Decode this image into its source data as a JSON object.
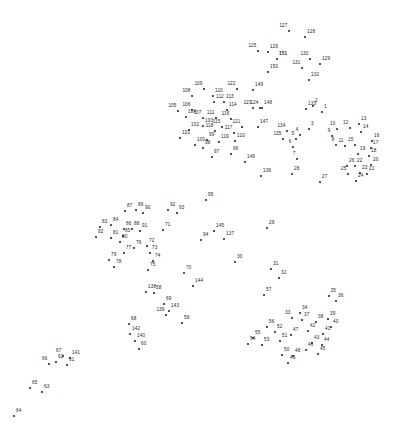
{
  "puzzle": {
    "type": "connect-the-dots",
    "width": 396,
    "height": 445,
    "background_color": "#ffffff",
    "dot_color": "#1a1a1a",
    "label_color": "#1a1a1a",
    "total_dots": 151,
    "dots": [
      {
        "n": "1",
        "x": 322,
        "y": 112,
        "pos": "ne"
      },
      {
        "n": "2",
        "x": 313,
        "y": 106,
        "pos": "ne"
      },
      {
        "n": "3",
        "x": 309,
        "y": 129,
        "pos": "ne"
      },
      {
        "n": "4",
        "x": 300,
        "y": 135,
        "pos": "nw"
      },
      {
        "n": "5",
        "x": 296,
        "y": 139,
        "pos": "nw"
      },
      {
        "n": "6",
        "x": 293,
        "y": 147,
        "pos": "nw"
      },
      {
        "n": "7",
        "x": 297,
        "y": 159,
        "pos": "nw"
      },
      {
        "n": "8",
        "x": 336,
        "y": 145,
        "pos": "nw"
      },
      {
        "n": "9",
        "x": 332,
        "y": 136,
        "pos": "nw"
      },
      {
        "n": "10",
        "x": 337,
        "y": 129,
        "pos": "nw"
      },
      {
        "n": "11",
        "x": 345,
        "y": 146,
        "pos": "nw"
      },
      {
        "n": "12",
        "x": 350,
        "y": 128,
        "pos": "nw"
      },
      {
        "n": "13",
        "x": 359,
        "y": 124,
        "pos": "ne"
      },
      {
        "n": "14",
        "x": 361,
        "y": 132,
        "pos": "ne"
      },
      {
        "n": "15",
        "x": 355,
        "y": 145,
        "pos": "nw"
      },
      {
        "n": "16",
        "x": 372,
        "y": 141,
        "pos": "ne"
      },
      {
        "n": "17",
        "x": 371,
        "y": 148,
        "pos": "ne"
      },
      {
        "n": "18",
        "x": 369,
        "y": 156,
        "pos": "ne"
      },
      {
        "n": "19",
        "x": 358,
        "y": 154,
        "pos": "ne"
      },
      {
        "n": "20",
        "x": 371,
        "y": 165,
        "pos": "ne"
      },
      {
        "n": "21",
        "x": 367,
        "y": 174,
        "pos": "ne"
      },
      {
        "n": "22",
        "x": 355,
        "y": 166,
        "pos": "ne"
      },
      {
        "n": "23",
        "x": 360,
        "y": 173,
        "pos": "ne"
      },
      {
        "n": "24",
        "x": 356,
        "y": 181,
        "pos": "ne"
      },
      {
        "n": "25",
        "x": 348,
        "y": 174,
        "pos": "nw"
      },
      {
        "n": "26",
        "x": 347,
        "y": 166,
        "pos": "ne"
      },
      {
        "n": "27",
        "x": 320,
        "y": 182,
        "pos": "ne"
      },
      {
        "n": "28",
        "x": 292,
        "y": 174,
        "pos": "ne"
      },
      {
        "n": "29",
        "x": 267,
        "y": 228,
        "pos": "ne"
      },
      {
        "n": "30",
        "x": 235,
        "y": 262,
        "pos": "ne"
      },
      {
        "n": "31",
        "x": 271,
        "y": 269,
        "pos": "ne"
      },
      {
        "n": "32",
        "x": 279,
        "y": 278,
        "pos": "ne"
      },
      {
        "n": "33",
        "x": 292,
        "y": 318,
        "pos": "nw"
      },
      {
        "n": "34",
        "x": 300,
        "y": 313,
        "pos": "ne"
      },
      {
        "n": "35",
        "x": 329,
        "y": 296,
        "pos": "n"
      },
      {
        "n": "36",
        "x": 336,
        "y": 301,
        "pos": "ne"
      },
      {
        "n": "37",
        "x": 302,
        "y": 320,
        "pos": "ne"
      },
      {
        "n": "38",
        "x": 316,
        "y": 322,
        "pos": "ne"
      },
      {
        "n": "39",
        "x": 328,
        "y": 319,
        "pos": "ne"
      },
      {
        "n": "40",
        "x": 331,
        "y": 327,
        "pos": "ne"
      },
      {
        "n": "41",
        "x": 323,
        "y": 334,
        "pos": "ne"
      },
      {
        "n": "42",
        "x": 308,
        "y": 331,
        "pos": "ne"
      },
      {
        "n": "43",
        "x": 312,
        "y": 343,
        "pos": "ne"
      },
      {
        "n": "44",
        "x": 322,
        "y": 345,
        "pos": "ne"
      },
      {
        "n": "45",
        "x": 318,
        "y": 354,
        "pos": "ne"
      },
      {
        "n": "46",
        "x": 306,
        "y": 350,
        "pos": "ne"
      },
      {
        "n": "47",
        "x": 291,
        "y": 335,
        "pos": "ne"
      },
      {
        "n": "48",
        "x": 293,
        "y": 356,
        "pos": "ne"
      },
      {
        "n": "49",
        "x": 288,
        "y": 363,
        "pos": "ne"
      },
      {
        "n": "50",
        "x": 282,
        "y": 355,
        "pos": "ne"
      },
      {
        "n": "51",
        "x": 280,
        "y": 341,
        "pos": "ne"
      },
      {
        "n": "52",
        "x": 275,
        "y": 332,
        "pos": "ne"
      },
      {
        "n": "53",
        "x": 262,
        "y": 345,
        "pos": "ne"
      },
      {
        "n": "54",
        "x": 248,
        "y": 344,
        "pos": "ne"
      },
      {
        "n": "55",
        "x": 253,
        "y": 338,
        "pos": "ne"
      },
      {
        "n": "56",
        "x": 267,
        "y": 327,
        "pos": "ne"
      },
      {
        "n": "57",
        "x": 264,
        "y": 295,
        "pos": "ne"
      },
      {
        "n": "58",
        "x": 154,
        "y": 293,
        "pos": "ne"
      },
      {
        "n": "59",
        "x": 182,
        "y": 323,
        "pos": "ne"
      },
      {
        "n": "60",
        "x": 139,
        "y": 349,
        "pos": "ne"
      },
      {
        "n": "61",
        "x": 67,
        "y": 365,
        "pos": "ne"
      },
      {
        "n": "62",
        "x": 56,
        "y": 362,
        "pos": "ne"
      },
      {
        "n": "63",
        "x": 42,
        "y": 392,
        "pos": "ne"
      },
      {
        "n": "64",
        "x": 14,
        "y": 416,
        "pos": "ne"
      },
      {
        "n": "65",
        "x": 30,
        "y": 388,
        "pos": "ne"
      },
      {
        "n": "66",
        "x": 49,
        "y": 364,
        "pos": "nw"
      },
      {
        "n": "67",
        "x": 63,
        "y": 356,
        "pos": "nw"
      },
      {
        "n": "68",
        "x": 129,
        "y": 324,
        "pos": "ne"
      },
      {
        "n": "69",
        "x": 164,
        "y": 304,
        "pos": "ne"
      },
      {
        "n": "70",
        "x": 184,
        "y": 273,
        "pos": "ne"
      },
      {
        "n": "71",
        "x": 163,
        "y": 230,
        "pos": "ne"
      },
      {
        "n": "72",
        "x": 147,
        "y": 246,
        "pos": "ne"
      },
      {
        "n": "73",
        "x": 150,
        "y": 253,
        "pos": "ne"
      },
      {
        "n": "74",
        "x": 153,
        "y": 261,
        "pos": "ne"
      },
      {
        "n": "75",
        "x": 148,
        "y": 270,
        "pos": "ne"
      },
      {
        "n": "76",
        "x": 134,
        "y": 248,
        "pos": "ne"
      },
      {
        "n": "77",
        "x": 124,
        "y": 253,
        "pos": "ne"
      },
      {
        "n": "78",
        "x": 114,
        "y": 267,
        "pos": "ne"
      },
      {
        "n": "79",
        "x": 109,
        "y": 260,
        "pos": "ne"
      },
      {
        "n": "80",
        "x": 120,
        "y": 242,
        "pos": "ne"
      },
      {
        "n": "81",
        "x": 111,
        "y": 238,
        "pos": "ne"
      },
      {
        "n": "82",
        "x": 96,
        "y": 237,
        "pos": "ne"
      },
      {
        "n": "83",
        "x": 100,
        "y": 227,
        "pos": "ne"
      },
      {
        "n": "84",
        "x": 111,
        "y": 225,
        "pos": "ne"
      },
      {
        "n": "85",
        "x": 123,
        "y": 236,
        "pos": "ne"
      },
      {
        "n": "86",
        "x": 124,
        "y": 229,
        "pos": "ne"
      },
      {
        "n": "87",
        "x": 125,
        "y": 211,
        "pos": "ne"
      },
      {
        "n": "88",
        "x": 132,
        "y": 229,
        "pos": "ne"
      },
      {
        "n": "89",
        "x": 136,
        "y": 210,
        "pos": "ne"
      },
      {
        "n": "90",
        "x": 143,
        "y": 213,
        "pos": "ne"
      },
      {
        "n": "91",
        "x": 140,
        "y": 231,
        "pos": "ne"
      },
      {
        "n": "92",
        "x": 168,
        "y": 210,
        "pos": "ne"
      },
      {
        "n": "93",
        "x": 177,
        "y": 213,
        "pos": "ne"
      },
      {
        "n": "94",
        "x": 201,
        "y": 240,
        "pos": "ne"
      },
      {
        "n": "95",
        "x": 206,
        "y": 200,
        "pos": "ne"
      },
      {
        "n": "96",
        "x": 231,
        "y": 154,
        "pos": "ne"
      },
      {
        "n": "97",
        "x": 212,
        "y": 157,
        "pos": "ne"
      },
      {
        "n": "98",
        "x": 203,
        "y": 148,
        "pos": "ne"
      },
      {
        "n": "99",
        "x": 207,
        "y": 140,
        "pos": "ne"
      },
      {
        "n": "100",
        "x": 195,
        "y": 145,
        "pos": "ne"
      },
      {
        "n": "101",
        "x": 180,
        "y": 138,
        "pos": "ne"
      },
      {
        "n": "102",
        "x": 189,
        "y": 130,
        "pos": "ne"
      },
      {
        "n": "103",
        "x": 203,
        "y": 126,
        "pos": "ne"
      },
      {
        "n": "104",
        "x": 186,
        "y": 117,
        "pos": "ne"
      },
      {
        "n": "105",
        "x": 178,
        "y": 111,
        "pos": "nw"
      },
      {
        "n": "106",
        "x": 192,
        "y": 110,
        "pos": "nw"
      },
      {
        "n": "107",
        "x": 203,
        "y": 118,
        "pos": "nw"
      },
      {
        "n": "108",
        "x": 192,
        "y": 96,
        "pos": "nw"
      },
      {
        "n": "109",
        "x": 204,
        "y": 89,
        "pos": "nw"
      },
      {
        "n": "110",
        "x": 213,
        "y": 96,
        "pos": "ne"
      },
      {
        "n": "111",
        "x": 216,
        "y": 118,
        "pos": "nw"
      },
      {
        "n": "112",
        "x": 214,
        "y": 102,
        "pos": "ne"
      },
      {
        "n": "113",
        "x": 224,
        "y": 102,
        "pos": "ne"
      },
      {
        "n": "114",
        "x": 227,
        "y": 110,
        "pos": "ne"
      },
      {
        "n": "115",
        "x": 222,
        "y": 127,
        "pos": "nw"
      },
      {
        "n": "116",
        "x": 231,
        "y": 119,
        "pos": "nw"
      },
      {
        "n": "117",
        "x": 234,
        "y": 133,
        "pos": "nw"
      },
      {
        "n": "118",
        "x": 215,
        "y": 131,
        "pos": "nw"
      },
      {
        "n": "119",
        "x": 219,
        "y": 142,
        "pos": "ne"
      },
      {
        "n": "120",
        "x": 235,
        "y": 141,
        "pos": "ne"
      },
      {
        "n": "121",
        "x": 242,
        "y": 127,
        "pos": "nw"
      },
      {
        "n": "122",
        "x": 237,
        "y": 89,
        "pos": "nw"
      },
      {
        "n": "123",
        "x": 253,
        "y": 108,
        "pos": "nw"
      },
      {
        "n": "124",
        "x": 260,
        "y": 108,
        "pos": "nw"
      },
      {
        "n": "125",
        "x": 258,
        "y": 51,
        "pos": "nw"
      },
      {
        "n": "126",
        "x": 268,
        "y": 52,
        "pos": "ne"
      },
      {
        "n": "127",
        "x": 289,
        "y": 31,
        "pos": "nw"
      },
      {
        "n": "128",
        "x": 305,
        "y": 37,
        "pos": "ne"
      },
      {
        "n": "129",
        "x": 320,
        "y": 64,
        "pos": "ne"
      },
      {
        "n": "130",
        "x": 310,
        "y": 59,
        "pos": "nw"
      },
      {
        "n": "131",
        "x": 302,
        "y": 68,
        "pos": "nw"
      },
      {
        "n": "132",
        "x": 309,
        "y": 80,
        "pos": "ne"
      },
      {
        "n": "133",
        "x": 306,
        "y": 109,
        "pos": "ne"
      },
      {
        "n": "134",
        "x": 287,
        "y": 131,
        "pos": "nw"
      },
      {
        "n": "135",
        "x": 283,
        "y": 139,
        "pos": "nw"
      },
      {
        "n": "136",
        "x": 261,
        "y": 176,
        "pos": "ne"
      },
      {
        "n": "137",
        "x": 224,
        "y": 239,
        "pos": "ne"
      },
      {
        "n": "138",
        "x": 146,
        "y": 292,
        "pos": "ne"
      },
      {
        "n": "139",
        "x": 166,
        "y": 315,
        "pos": "nw"
      },
      {
        "n": "140",
        "x": 135,
        "y": 341,
        "pos": "ne"
      },
      {
        "n": "141",
        "x": 70,
        "y": 358,
        "pos": "ne"
      },
      {
        "n": "142",
        "x": 130,
        "y": 334,
        "pos": "ne"
      },
      {
        "n": "143",
        "x": 169,
        "y": 311,
        "pos": "ne"
      },
      {
        "n": "144",
        "x": 193,
        "y": 286,
        "pos": "ne"
      },
      {
        "n": "145",
        "x": 214,
        "y": 231,
        "pos": "ne"
      },
      {
        "n": "146",
        "x": 245,
        "y": 162,
        "pos": "ne"
      },
      {
        "n": "147",
        "x": 258,
        "y": 127,
        "pos": "ne"
      },
      {
        "n": "148",
        "x": 262,
        "y": 108,
        "pos": "ne"
      },
      {
        "n": "149",
        "x": 253,
        "y": 90,
        "pos": "ne"
      },
      {
        "n": "150",
        "x": 268,
        "y": 72,
        "pos": "ne"
      },
      {
        "n": "151",
        "x": 277,
        "y": 59,
        "pos": "ne",
        "bold": true
      }
    ]
  }
}
